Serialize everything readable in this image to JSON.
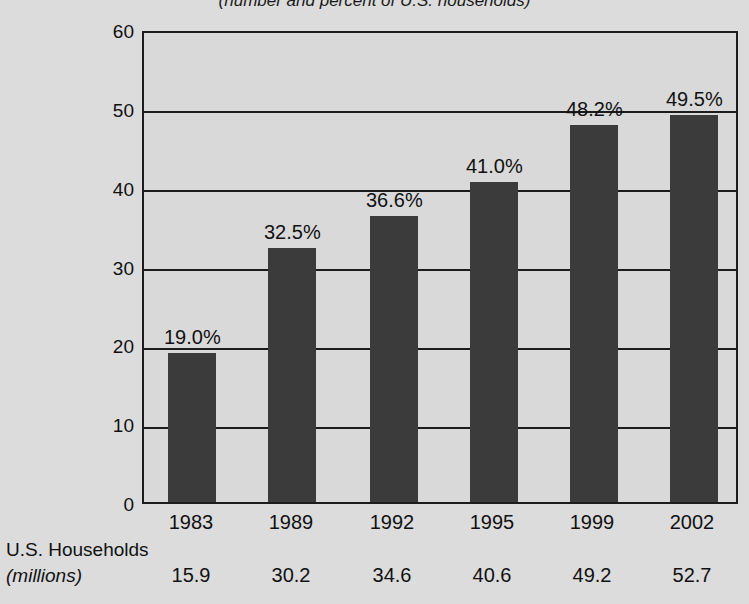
{
  "chart_data": {
    "type": "bar",
    "title": "",
    "subtitle": "(number and percent of U.S. households)",
    "xlabel": "",
    "ylabel": "",
    "ylim": [
      0,
      60
    ],
    "yticks": [
      0,
      10,
      20,
      30,
      40,
      50,
      60
    ],
    "ytick_labels": [
      "0",
      "10",
      "20",
      "30",
      "40",
      "50",
      "60"
    ],
    "grid": true,
    "legend": "none",
    "categories": [
      "1983",
      "1989",
      "1992",
      "1995",
      "1999",
      "2002"
    ],
    "values": [
      19.0,
      32.5,
      36.6,
      41.0,
      48.2,
      49.5
    ],
    "value_labels": [
      "19.0%",
      "32.5%",
      "36.6%",
      "41.0%",
      "48.2%",
      "49.5%"
    ],
    "series": [
      {
        "name": "Percent of U.S. households",
        "values": [
          19.0,
          32.5,
          36.6,
          41.0,
          48.2,
          49.5
        ]
      },
      {
        "name": "U.S. Households (millions)",
        "values": [
          15.9,
          30.2,
          34.6,
          40.6,
          49.2,
          52.7
        ]
      }
    ],
    "bar_color": "#3b3b3b",
    "plot_background": "#d9d9d9",
    "page_background": "#dcdcdc"
  },
  "table": {
    "row_header_line1": "U.S. Households",
    "row_header_line2": "(millions)",
    "households": [
      "15.9",
      "30.2",
      "34.6",
      "40.6",
      "49.2",
      "52.7"
    ]
  }
}
